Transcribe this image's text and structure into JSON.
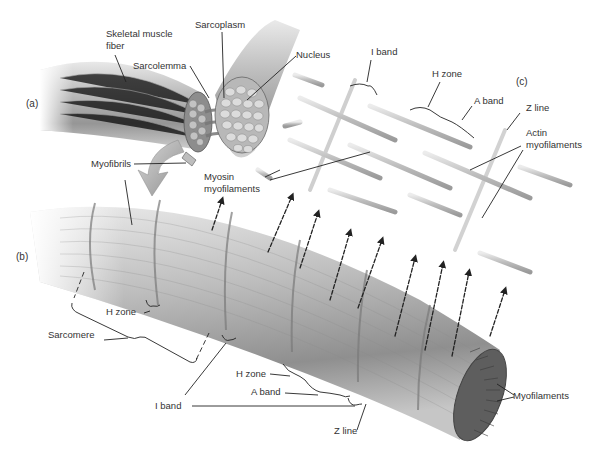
{
  "figure": {
    "panels": {
      "a": "(a)",
      "b": "(b)",
      "c": "(c)"
    },
    "panel_a": {
      "labels": {
        "skeletal_muscle_fiber_1": "Skeletal muscle",
        "skeletal_muscle_fiber_2": "fiber",
        "sarcoplasm": "Sarcoplasm",
        "sarcolemma": "Sarcolemma",
        "nucleus": "Nucleus",
        "myofibrils": "Myofibrils"
      }
    },
    "panel_b": {
      "labels": {
        "h_zone_upper": "H zone",
        "sarcomere": "Sarcomere",
        "h_zone_lower": "H zone",
        "a_band": "A band",
        "i_band": "I band",
        "z_line": "Z line",
        "myofilaments": "Myofilaments"
      }
    },
    "panel_c": {
      "labels": {
        "i_band": "I band",
        "h_zone": "H zone",
        "a_band": "A band",
        "z_line": "Z line",
        "actin_1": "Actin",
        "actin_2": "myofilaments",
        "myosin_1": "Myosin",
        "myosin_2": "myofilaments"
      }
    },
    "colors": {
      "background": "#ffffff",
      "label_text": "#333333",
      "leader_line": "#222222",
      "fiber_mid": "#a8a8a8",
      "fiber_dark": "#6e6e6e",
      "filament": "#c4c4c4"
    }
  }
}
